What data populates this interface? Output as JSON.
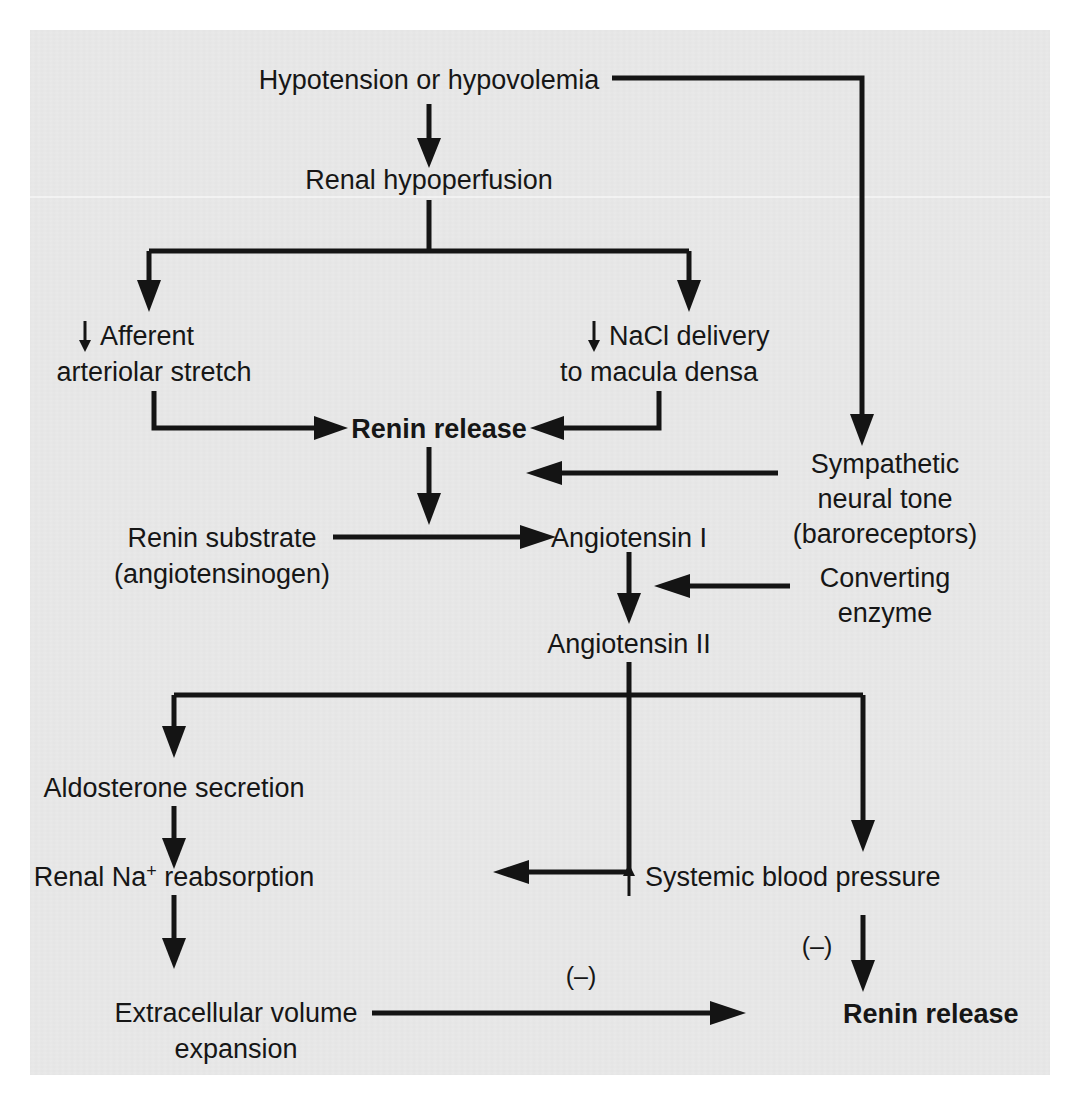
{
  "figure": {
    "type": "flowchart",
    "background_color": "#e9e9e9",
    "line_color": "#141414",
    "page_background": "#ffffff"
  },
  "nodes": {
    "hypotension": {
      "label": "Hypotension or hypovolemia",
      "bold": false
    },
    "renal_hypoperfusion": {
      "label": "Renal hypoperfusion",
      "bold": false
    },
    "afferent_line1": {
      "label": "Afferent",
      "arrow_prefix": "↓",
      "bold": false
    },
    "afferent_line2": {
      "label": "arteriolar stretch",
      "bold": false
    },
    "nacl_line1": {
      "label": "NaCl delivery",
      "arrow_prefix": "↓",
      "bold": false
    },
    "nacl_line2": {
      "label": "to macula densa",
      "bold": false
    },
    "renin_release_top": {
      "label": "Renin release",
      "bold": true
    },
    "sympathetic_line1": {
      "label": "Sympathetic",
      "bold": false
    },
    "sympathetic_line2": {
      "label": "neural tone",
      "bold": false
    },
    "sympathetic_line3": {
      "label": "(baroreceptors)",
      "bold": false
    },
    "renin_substrate_line1": {
      "label": "Renin substrate",
      "bold": false
    },
    "renin_substrate_line2": {
      "label": "(angiotensinogen)",
      "bold": false
    },
    "angiotensin_i": {
      "label": "Angiotensin I",
      "bold": false
    },
    "converting_line1": {
      "label": "Converting",
      "bold": false
    },
    "converting_line2": {
      "label": "enzyme",
      "bold": false
    },
    "angiotensin_ii": {
      "label": "Angiotensin II",
      "bold": false
    },
    "aldosterone": {
      "label": "Aldosterone secretion",
      "bold": false
    },
    "renal_na_reabsorption": {
      "label_before": "Renal Na",
      "label_sup": "+",
      "label_after": " reabsorption",
      "bold": false
    },
    "systemic_bp": {
      "label": "Systemic blood pressure",
      "arrow_prefix": "↑",
      "bold": false
    },
    "ecf_line1": {
      "label": "Extracellular volume",
      "bold": false
    },
    "ecf_line2": {
      "label": "expansion",
      "bold": false
    },
    "renin_release_bottom": {
      "label": "Renin release",
      "bold": true
    }
  },
  "annotations": {
    "negative_feedback_left": "(–)",
    "negative_feedback_right": "(–)"
  },
  "edges": [
    {
      "from": "hypotension",
      "to": "renal_hypoperfusion",
      "kind": "arrow-down"
    },
    {
      "from": "hypotension",
      "to": "sympathetic_neural_tone",
      "kind": "elbow-right-down"
    },
    {
      "from": "renal_hypoperfusion",
      "to": "afferent_arteriolar_stretch",
      "kind": "split-left"
    },
    {
      "from": "renal_hypoperfusion",
      "to": "nacl_delivery",
      "kind": "split-right"
    },
    {
      "from": "afferent_arteriolar_stretch",
      "to": "renin_release_top",
      "kind": "elbow-right"
    },
    {
      "from": "nacl_delivery",
      "to": "renin_release_top",
      "kind": "elbow-left"
    },
    {
      "from": "sympathetic_neural_tone",
      "to": "renin_release_top",
      "kind": "arrow-left"
    },
    {
      "from": "renin_release_top",
      "to": "angiotensin_i",
      "kind": "arrow-down"
    },
    {
      "from": "renin_substrate",
      "to": "angiotensin_i",
      "kind": "arrow-right"
    },
    {
      "from": "angiotensin_i",
      "to": "angiotensin_ii",
      "kind": "arrow-down"
    },
    {
      "from": "converting_enzyme",
      "to": "angiotensin_i_to_ii",
      "kind": "arrow-left"
    },
    {
      "from": "angiotensin_ii",
      "to": "aldosterone",
      "kind": "split-left"
    },
    {
      "from": "angiotensin_ii",
      "to": "systemic_bp",
      "kind": "split-right"
    },
    {
      "from": "angiotensin_ii",
      "to": "renal_na_reabsorption",
      "kind": "elbow-down-left"
    },
    {
      "from": "aldosterone",
      "to": "renal_na_reabsorption",
      "kind": "arrow-down"
    },
    {
      "from": "renal_na_reabsorption",
      "to": "ecf_expansion",
      "kind": "arrow-down"
    },
    {
      "from": "ecf_expansion",
      "to": "renin_release_bottom",
      "kind": "arrow-right",
      "label": "(–)"
    },
    {
      "from": "systemic_bp",
      "to": "renin_release_bottom",
      "kind": "arrow-down",
      "label": "(–)"
    }
  ]
}
